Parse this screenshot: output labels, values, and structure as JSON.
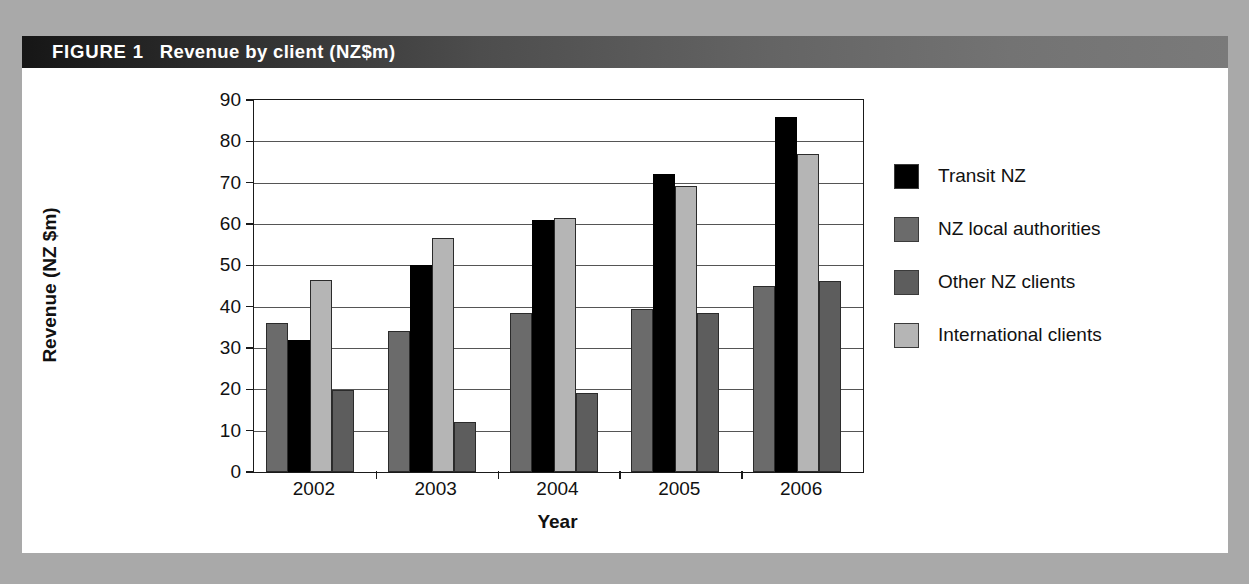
{
  "figure": {
    "label": "FIGURE 1",
    "title": "Revenue by client (NZ$m)"
  },
  "colors": {
    "page_background": "#a9a9a9",
    "panel_background": "#ffffff",
    "title_bar_dark": "#161616",
    "title_bar_light": "#7a7a7a",
    "series_transit_nz": "#000000",
    "series_nz_local_authorities": "#6b6b6b",
    "series_other_nz_clients": "#5d5d5d",
    "series_international_clients": "#b5b5b5",
    "axis_line": "#1a1a1a",
    "gridline": "#555555"
  },
  "chart_data": {
    "type": "bar",
    "title": "Revenue by client (NZ$m)",
    "xlabel": "Year",
    "ylabel": "Revenue (NZ $m)",
    "categories": [
      "2002",
      "2003",
      "2004",
      "2005",
      "2006"
    ],
    "ylim": [
      0,
      90
    ],
    "yticks": [
      0,
      10,
      20,
      30,
      40,
      50,
      60,
      70,
      80,
      90
    ],
    "ytick_labels": [
      "0",
      "10",
      "20",
      "30",
      "40",
      "50",
      "60",
      "70",
      "80",
      "90"
    ],
    "grid": true,
    "legend_position": "right",
    "bar_order_in_group": [
      "NZ local authorities",
      "Transit NZ",
      "International clients",
      "Other NZ clients"
    ],
    "series": [
      {
        "name": "Transit NZ",
        "color": "#000000",
        "values": [
          32,
          50,
          61,
          72,
          86
        ]
      },
      {
        "name": "NZ local authorities",
        "color": "#6b6b6b",
        "values": [
          36,
          34,
          38.5,
          39.5,
          45
        ]
      },
      {
        "name": "Other NZ clients",
        "color": "#5d5d5d",
        "values": [
          19.8,
          12.2,
          19,
          38.5,
          46.3
        ]
      },
      {
        "name": "International clients",
        "color": "#b5b5b5",
        "values": [
          46.5,
          56.5,
          61.5,
          69.3,
          77
        ]
      }
    ]
  },
  "legend": {
    "items": [
      {
        "label": "Transit NZ",
        "color": "#000000"
      },
      {
        "label": "NZ local authorities",
        "color": "#6b6b6b"
      },
      {
        "label": "Other NZ clients",
        "color": "#5d5d5d"
      },
      {
        "label": "International clients",
        "color": "#b5b5b5"
      }
    ]
  }
}
